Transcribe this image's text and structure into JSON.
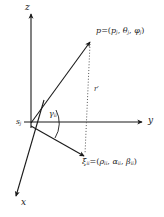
{
  "figure": {
    "background_color": "#ffffff",
    "stroke_color": "#1a1a1a",
    "width": 164,
    "height": 217
  },
  "axes": {
    "z": {
      "label": "z",
      "direction": "up"
    },
    "y": {
      "label": "y",
      "direction": "right"
    },
    "x": {
      "label": "x",
      "direction": "down-left"
    }
  },
  "origin": {
    "symbol": "s",
    "subscript": "j",
    "name": "sensor-origin"
  },
  "points": {
    "p": {
      "symbol": "p",
      "equals": "=",
      "open": "(",
      "comp1": "p",
      "comp1_sub": "j",
      "sep1": ",",
      "comp2": "θ",
      "comp2_sub": "j",
      "sep2": ",",
      "comp3": "φ",
      "comp3_sub": "j",
      "close": ")",
      "name": "target-point-p"
    },
    "xi": {
      "symbol": "ξ",
      "symbol_sub": "ii",
      "equals": "=",
      "open": "(",
      "comp1": "ρ",
      "comp1_sub": "ii",
      "sep1": ",",
      "comp2": "α",
      "comp2_sub": "ii",
      "sep2": ",",
      "comp3": "β",
      "comp3_sub": "ii",
      "close": ")",
      "name": "target-point-xi"
    }
  },
  "annotations": {
    "angle": {
      "symbol": "γ",
      "subscript": "ii",
      "name": "angle-gamma"
    },
    "distance": {
      "symbol": "r",
      "prime": "′",
      "name": "distance-r-prime"
    }
  }
}
